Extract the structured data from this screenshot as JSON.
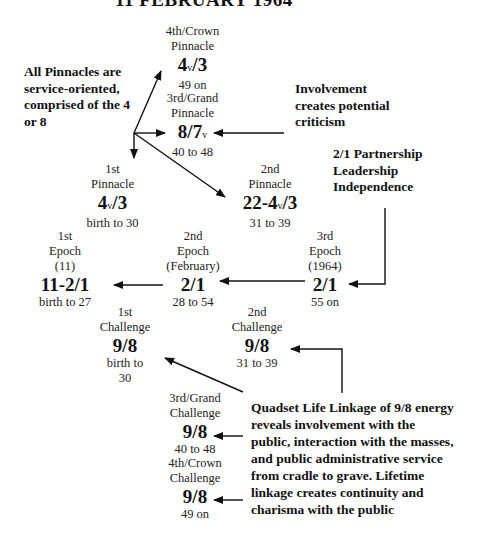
{
  "title": "11 FEBRUARY 1964",
  "pinnacles": {
    "crown": {
      "label1": "4th/Crown",
      "label2": "Pinnacle",
      "main": "4",
      "sub": "v",
      "rest": "/3",
      "range": "49 on"
    },
    "grand": {
      "label1": "3rd/Grand",
      "label2": "Pinnacle",
      "main": "8/7",
      "sub": "v",
      "rest": "",
      "range": "40 to 48"
    },
    "first": {
      "label1": "1st",
      "label2": "Pinnacle",
      "main": "4",
      "sub": "v",
      "rest": "/3",
      "range": "birth to 30"
    },
    "second": {
      "label1": "2nd",
      "label2": "Pinnacle",
      "main": "22-4",
      "sub": "v",
      "rest": "/3",
      "range": "31 to 39"
    }
  },
  "epochs": {
    "first": {
      "label1": "1st",
      "label2": "Epoch",
      "label3": "(11)",
      "value": "11-2/1",
      "range": "birth to 27"
    },
    "second": {
      "label1": "2nd",
      "label2": "Epoch",
      "label3": "(February)",
      "value": "2/1",
      "range": "28 to 54"
    },
    "third": {
      "label1": "3rd",
      "label2": "Epoch",
      "label3": "(1964)",
      "value": "2/1",
      "range": "55 on"
    }
  },
  "challenges": {
    "first": {
      "label1": "1st",
      "label2": "Challenge",
      "value": "9/8",
      "range1": "birth to",
      "range2": "30"
    },
    "second": {
      "label1": "2nd",
      "label2": "Challenge",
      "value": "9/8",
      "range": "31 to 39"
    },
    "grand": {
      "label1": "3rd/Grand",
      "label2": "Challenge",
      "value": "9/8",
      "range": "40 to 48"
    },
    "crown": {
      "label1": "4th/Crown",
      "label2": "Challenge",
      "value": "9/8",
      "range": "49 on"
    }
  },
  "notes": {
    "pinnacles": [
      "All Pinnacles are",
      "service-oriented,",
      "comprised of the 4",
      "or 8"
    ],
    "involvement": [
      "Involvement",
      "creates potential",
      "criticism"
    ],
    "partnership": [
      "2/1 Partnership",
      "Leadership",
      "Independence"
    ],
    "quadset": [
      "Quadset Life Linkage of 9/8 energy",
      "reveals involvement with the",
      "public, interaction with the masses,",
      "and public administrative service",
      "from cradle to grave.  Lifetime",
      "linkage creates continuity and",
      "charisma with the public"
    ]
  }
}
